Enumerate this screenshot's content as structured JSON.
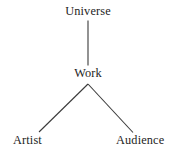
{
  "diagram": {
    "background_color": "#ffffff",
    "line_color": "#3a3a3a",
    "text_color": "#242424",
    "nodes": [
      {
        "id": "universe",
        "label": "Universe"
      },
      {
        "id": "work",
        "label": "Work"
      },
      {
        "id": "artist",
        "label": "Artist"
      },
      {
        "id": "audience",
        "label": "Audience"
      }
    ],
    "edges": [
      {
        "id": "universe-work",
        "from": "Universe",
        "to": "Work",
        "style": "vertical-line"
      },
      {
        "id": "work-artist",
        "from": "Work",
        "to": "Artist",
        "style": "diagonal-line"
      },
      {
        "id": "work-audience",
        "from": "Work",
        "to": "Audience",
        "style": "diagonal-line"
      }
    ]
  }
}
